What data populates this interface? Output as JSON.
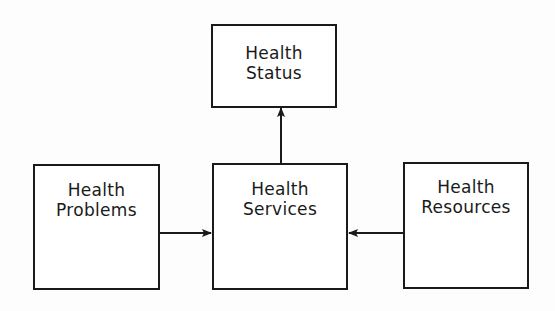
{
  "diagram": {
    "type": "flow",
    "nodes": [
      {
        "id": "status",
        "line1": "Health",
        "line2": "Status"
      },
      {
        "id": "problems",
        "line1": "Health",
        "line2": "Problems"
      },
      {
        "id": "services",
        "line1": "Health",
        "line2": "Services"
      },
      {
        "id": "resources",
        "line1": "Health",
        "line2": "Resources"
      }
    ],
    "edges": [
      {
        "from": "problems",
        "to": "services"
      },
      {
        "from": "resources",
        "to": "services"
      },
      {
        "from": "services",
        "to": "status"
      }
    ],
    "colors": {
      "stroke": "#1a1a1a",
      "background": "#ffffff"
    }
  }
}
